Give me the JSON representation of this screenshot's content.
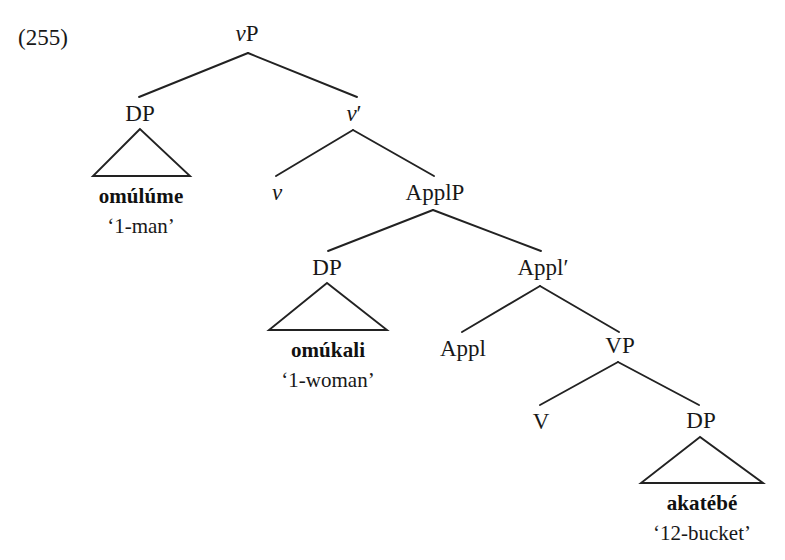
{
  "figure": {
    "example_number": "(255)",
    "caption": ""
  },
  "tree": {
    "nodes": [
      {
        "id": "vP",
        "label_italic": "v",
        "label_rest": "P",
        "x": 247,
        "y": 33
      },
      {
        "id": "DP1",
        "label_italic": "",
        "label_rest": "DP",
        "x": 140,
        "y": 113
      },
      {
        "id": "vbar",
        "label_italic": "v",
        "label_rest": "′",
        "x": 354,
        "y": 113
      },
      {
        "id": "v",
        "label_italic": "v",
        "label_rest": "",
        "x": 277,
        "y": 192
      },
      {
        "id": "ApplP",
        "label_italic": "",
        "label_rest": "ApplP",
        "x": 435,
        "y": 192
      },
      {
        "id": "DP2",
        "label_italic": "",
        "label_rest": "DP",
        "x": 327,
        "y": 267
      },
      {
        "id": "Applbar",
        "label_italic": "",
        "label_rest": "Appl′",
        "x": 543,
        "y": 267
      },
      {
        "id": "Appl",
        "label_italic": "",
        "label_rest": "Appl",
        "x": 463,
        "y": 348
      },
      {
        "id": "VP",
        "label_italic": "",
        "label_rest": "VP",
        "x": 620,
        "y": 345
      },
      {
        "id": "V",
        "label_italic": "",
        "label_rest": "V",
        "x": 541,
        "y": 421
      },
      {
        "id": "DP3",
        "label_italic": "",
        "label_rest": "DP",
        "x": 701,
        "y": 420
      }
    ],
    "edges": [
      {
        "from": "vP",
        "to": "DP1",
        "x1": 248,
        "y1": 53,
        "x2": 139,
        "y2": 97
      },
      {
        "from": "vP",
        "to": "vbar",
        "x1": 248,
        "y1": 53,
        "x2": 357,
        "y2": 97
      },
      {
        "from": "vbar",
        "to": "v",
        "x1": 353,
        "y1": 130,
        "x2": 276,
        "y2": 176
      },
      {
        "from": "vbar",
        "to": "ApplP",
        "x1": 353,
        "y1": 130,
        "x2": 434,
        "y2": 176
      },
      {
        "from": "ApplP",
        "to": "DP2",
        "x1": 433,
        "y1": 210,
        "x2": 328,
        "y2": 251
      },
      {
        "from": "ApplP",
        "to": "Applbar",
        "x1": 433,
        "y1": 210,
        "x2": 541,
        "y2": 251
      },
      {
        "from": "Applbar",
        "to": "Appl",
        "x1": 540,
        "y1": 286,
        "x2": 462,
        "y2": 332
      },
      {
        "from": "Applbar",
        "to": "VP",
        "x1": 540,
        "y1": 286,
        "x2": 619,
        "y2": 332
      },
      {
        "from": "VP",
        "to": "V",
        "x1": 618,
        "y1": 362,
        "x2": 540,
        "y2": 405
      },
      {
        "from": "VP",
        "to": "DP3",
        "x1": 618,
        "y1": 362,
        "x2": 699,
        "y2": 405
      }
    ],
    "triangles": [
      {
        "parent": "DP1",
        "apex_x": 140,
        "apex_y": 129,
        "left_x": 93,
        "right_x": 190,
        "base_y": 176
      },
      {
        "parent": "DP2",
        "apex_x": 327,
        "apex_y": 283,
        "left_x": 269,
        "right_x": 387,
        "base_y": 330
      },
      {
        "parent": "DP3",
        "apex_x": 700,
        "apex_y": 437,
        "left_x": 641,
        "right_x": 763,
        "base_y": 483
      }
    ],
    "leaves": [
      {
        "parent": "DP1",
        "word": "omúlúme",
        "gloss": "‘1-man’",
        "x": 141,
        "y": 196,
        "gloss_y": 226
      },
      {
        "parent": "DP2",
        "word": "omúkali",
        "gloss": "‘1-woman’",
        "x": 328,
        "y": 350,
        "gloss_y": 380
      },
      {
        "parent": "DP3",
        "word": "akatébé",
        "gloss": "‘12-bucket’",
        "x": 702,
        "y": 503,
        "gloss_y": 533
      }
    ]
  },
  "style": {
    "line_color": "#222222",
    "background": "#ffffff"
  }
}
